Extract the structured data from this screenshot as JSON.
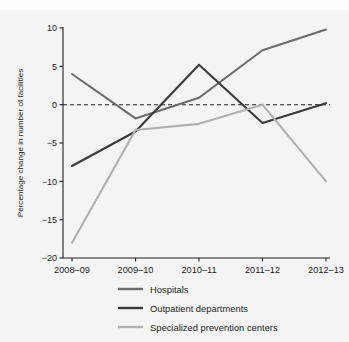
{
  "figure": {
    "top_caption": "",
    "background": "#f4f4f4"
  },
  "chart_data": {
    "type": "line",
    "title": "",
    "xlabel": "",
    "ylabel": "Percentage change in number of facilities",
    "categories": [
      "2008–09",
      "2009–10",
      "2010–11",
      "2011–12",
      "2012–13"
    ],
    "ylim": [
      -20,
      10
    ],
    "yticks": [
      10,
      5,
      0,
      -5,
      -10,
      -15,
      -20
    ],
    "ytick_labels": [
      "10",
      "5",
      "0",
      "−5",
      "−10",
      "−15",
      "−20"
    ],
    "grid": false,
    "zero_line": {
      "value": 0,
      "style": "dashed",
      "color": "#231f20"
    },
    "legend_position": "bottom",
    "series": [
      {
        "name": "Hospitals",
        "color": "#6b6b6b",
        "values": [
          4.0,
          -1.8,
          0.9,
          7.1,
          9.8
        ]
      },
      {
        "name": "Outpatient departments",
        "color": "#3a3a3a",
        "values": [
          -8.0,
          -3.5,
          5.2,
          -2.4,
          0.2
        ]
      },
      {
        "name": "Specialized prevention centers",
        "color": "#b0b0b0",
        "values": [
          -18.0,
          -3.3,
          -2.5,
          0.0,
          -10.0
        ]
      }
    ]
  }
}
